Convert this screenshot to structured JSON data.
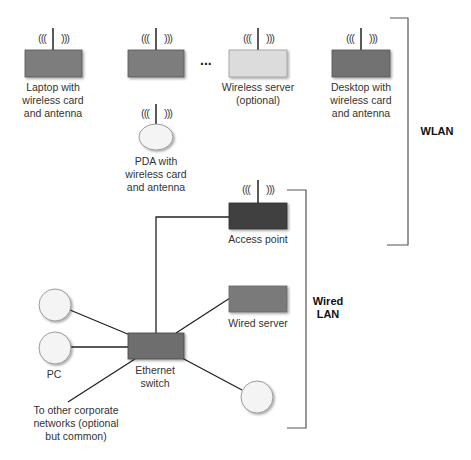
{
  "colors": {
    "line": "#222222",
    "bracket": "#555555",
    "box_dark": "#444444",
    "box_mid": "#7a7a7a",
    "box_light": "#dcdcdc",
    "circle_fill": "#f4f4f4",
    "circle_stroke": "#888888"
  },
  "wireless_wave_left": "(((",
  "wireless_wave_right": ")))",
  "ellipsis": "...",
  "wlan": {
    "label": "WLAN",
    "devices": [
      {
        "id": "laptop",
        "label": "Laptop with\nwireless card\nand antenna"
      },
      {
        "id": "unnamed-device",
        "label": ""
      },
      {
        "id": "wireless-server",
        "label": "Wireless server\n(optional)"
      },
      {
        "id": "desktop",
        "label": "Desktop with\nwireless card\nand antenna"
      },
      {
        "id": "pda",
        "label": "PDA with\nwireless card\nand antenna"
      }
    ]
  },
  "wired_lan": {
    "label": "Wired\nLAN",
    "devices": [
      {
        "id": "access-point",
        "label": "Access point"
      },
      {
        "id": "wired-server",
        "label": "Wired server"
      },
      {
        "id": "ethernet-switch",
        "label": "Ethernet\nswitch"
      },
      {
        "id": "pc-1",
        "label": ""
      },
      {
        "id": "pc-2",
        "label": "PC"
      },
      {
        "id": "client-bottom-right",
        "label": ""
      }
    ],
    "external_link_label": "To other corporate\nnetworks (optional\nbut common)"
  }
}
